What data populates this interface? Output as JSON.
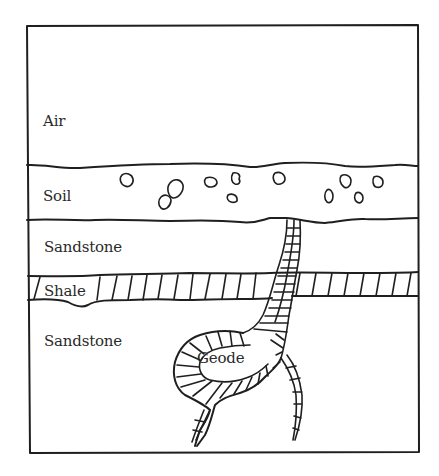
{
  "diagram": {
    "layers": [
      {
        "id": "air",
        "label": "Air"
      },
      {
        "id": "soil",
        "label": "Soil"
      },
      {
        "id": "sandstone-upper",
        "label": "Sandstone"
      },
      {
        "id": "shale",
        "label": "Shale"
      },
      {
        "id": "sandstone-lower",
        "label": "Sandstone"
      }
    ],
    "features": [
      {
        "id": "geode",
        "label": "Geode"
      }
    ],
    "colors": {
      "line": "#1f1f1f",
      "text": "#2a2a2a",
      "background": "#ffffff"
    }
  }
}
